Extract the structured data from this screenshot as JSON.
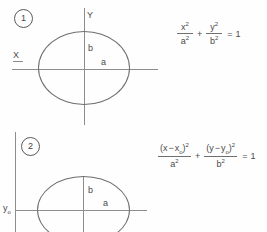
{
  "document": {
    "title": "Ellipse equations figure",
    "ink_color": "#4a4a4a",
    "line_color": "#8d8d8d",
    "background": "#fefefe"
  },
  "figures": [
    {
      "number": "1",
      "caption_label": "1",
      "axes": {
        "x_label": "X",
        "y_label": "Y"
      },
      "annotations": {
        "semi_minor": "b",
        "semi_major": "a"
      },
      "equation": {
        "term1": {
          "num_base": "x",
          "num_exp": "2",
          "den_base": "a",
          "den_exp": "2"
        },
        "operator": "+",
        "term2": {
          "num_base": "y",
          "num_exp": "2",
          "den_base": "b",
          "den_exp": "2"
        },
        "equals": "=",
        "rhs": "1",
        "plain": "x^2/a^2 + y^2/b^2 = 1"
      }
    },
    {
      "number": "2",
      "caption_label": "2",
      "axes": {
        "y_offset_label_base": "y",
        "y_offset_label_sub": "o"
      },
      "annotations": {
        "semi_minor": "b",
        "semi_major": "a"
      },
      "equation": {
        "term1": {
          "num_open": "(",
          "num_var": "x",
          "num_minus": "−",
          "num_offset_base": "x",
          "num_offset_sub": "o",
          "num_close": ")",
          "num_exp": "2",
          "den_base": "a",
          "den_exp": "2"
        },
        "operator": "+",
        "term2": {
          "num_open": "(",
          "num_var": "y",
          "num_minus": "−",
          "num_offset_base": "y",
          "num_offset_sub": "o",
          "num_close": ")",
          "num_exp": "2",
          "den_base": "b",
          "den_exp": "2"
        },
        "equals": "=",
        "rhs": "1",
        "plain": "(x - xo)^2/a^2 + (y - yo)^2/b^2 = 1"
      }
    }
  ]
}
